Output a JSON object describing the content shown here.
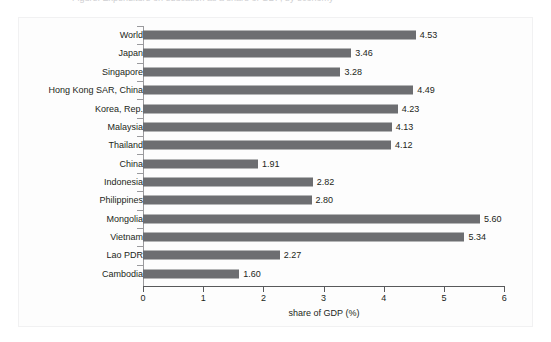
{
  "caption": {
    "text": "Figure: Expenditure on education as a share of GDP, by economy"
  },
  "colors": {
    "bar": "#6d6e71",
    "axis": "#58595b",
    "text": "#231f20",
    "panel_border": "#f1f1f2",
    "panel_background": "#fdfdfd"
  },
  "chart_data": {
    "type": "bar",
    "orientation": "horizontal",
    "title": "",
    "xlabel": "share of GDP (%)",
    "ylabel": "",
    "xlim": [
      0,
      6
    ],
    "xticks": [
      "0",
      "1",
      "2",
      "3",
      "4",
      "5",
      "6"
    ],
    "grid": false,
    "legend": null,
    "categories": [
      "World",
      "Japan",
      "Singapore",
      "Hong Kong SAR, China",
      "Korea, Rep.",
      "Malaysia",
      "Thailand",
      "China",
      "Indonesia",
      "Philippines",
      "Mongolia",
      "Vietnam",
      "Lao PDR",
      "Cambodia"
    ],
    "values": [
      4.53,
      3.46,
      3.28,
      4.49,
      4.23,
      4.13,
      4.12,
      1.91,
      2.82,
      2.8,
      5.6,
      5.34,
      2.27,
      1.6
    ],
    "value_labels": [
      "4.53",
      "3.46",
      "3.28",
      "4.49",
      "4.23",
      "4.13",
      "4.12",
      "1.91",
      "2.82",
      "2.80",
      "5.60",
      "5.34",
      "2.27",
      "1.60"
    ]
  }
}
